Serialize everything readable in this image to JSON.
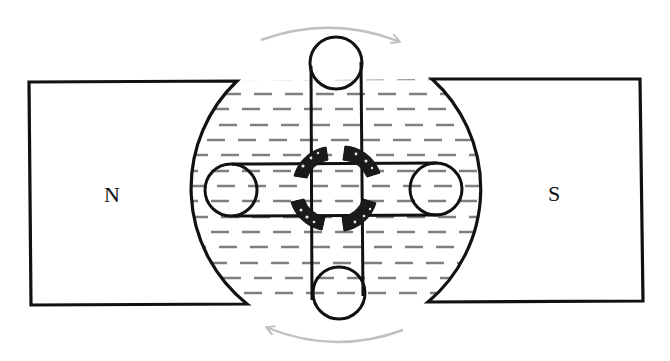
{
  "diagram": {
    "type": "dc-motor-armature-between-magnet-poles",
    "labels": {
      "north_pole": "N",
      "south_pole": "S"
    },
    "components": [
      {
        "name": "north-magnet-pole",
        "label": "N",
        "side": "left"
      },
      {
        "name": "south-magnet-pole",
        "label": "S",
        "side": "right"
      },
      {
        "name": "magnetic-field-region",
        "style": "dashed horizontal field lines"
      },
      {
        "name": "vertical-armature-coil",
        "ends": "circles top and bottom"
      },
      {
        "name": "horizontal-armature-coil",
        "ends": "circles left and right"
      },
      {
        "name": "commutator-ring",
        "segments": 4
      },
      {
        "name": "rotation-arrow-top",
        "direction": "clockwise"
      },
      {
        "name": "rotation-arrow-bottom",
        "direction": "clockwise"
      }
    ],
    "colors": {
      "line": "#111111",
      "field_lines": "#808080",
      "arrows": "#c0c0c0",
      "background": "#ffffff"
    }
  }
}
